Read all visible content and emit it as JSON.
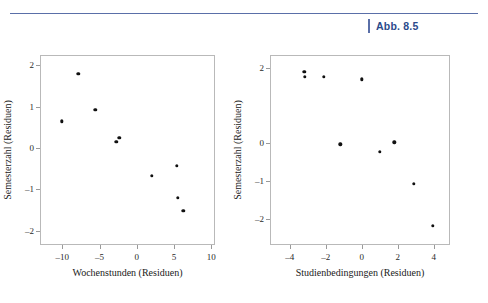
{
  "header": {
    "figure_label": "Abb. 8.5",
    "accent_color": "#2b4a8b",
    "rule_color": "#5a6fa8"
  },
  "chart_data": [
    {
      "id": "left",
      "type": "scatter",
      "title": "",
      "xlabel": "Wochenstunden (Residuen)",
      "ylabel": "Semesterzahl (Residuen)",
      "xlim": [
        -13,
        10.5
      ],
      "ylim": [
        -2.35,
        2.25
      ],
      "xticks": [
        -10,
        -5,
        0,
        5,
        10
      ],
      "xticklabels": [
        "–10",
        "–5",
        "0",
        "5",
        "10"
      ],
      "yticks": [
        2,
        1,
        0,
        -1,
        -2
      ],
      "yticklabels": [
        "2",
        "1",
        "0",
        "–1",
        "–2"
      ],
      "grid": false,
      "legend": "none",
      "marker_color": "#111111",
      "points": [
        {
          "x": -10.2,
          "y": 0.67
        },
        {
          "x": -8.0,
          "y": 1.82
        },
        {
          "x": -5.7,
          "y": 0.94
        },
        {
          "x": -2.9,
          "y": 0.17
        },
        {
          "x": -2.5,
          "y": 0.27
        },
        {
          "x": 1.9,
          "y": -0.65
        },
        {
          "x": 5.2,
          "y": -0.41
        },
        {
          "x": 5.4,
          "y": -1.19
        },
        {
          "x": 6.1,
          "y": -1.5
        }
      ]
    },
    {
      "id": "right",
      "type": "scatter",
      "title": "",
      "xlabel": "Studienbedingungen (Residuen)",
      "ylabel": "Semesterzahl (Residuen)",
      "xlim": [
        -5.1,
        4.9
      ],
      "ylim": [
        -2.7,
        2.35
      ],
      "xticks": [
        -4,
        -2,
        0,
        2,
        4
      ],
      "xticklabels": [
        "–4",
        "–2",
        "0",
        "2",
        "4"
      ],
      "yticks": [
        2,
        0,
        -1,
        -2
      ],
      "yticklabels": [
        "2",
        "0",
        "–1",
        "–2"
      ],
      "grid": false,
      "legend": "none",
      "marker_color": "#111111",
      "points": [
        {
          "x": -3.25,
          "y": 1.93
        },
        {
          "x": -3.22,
          "y": 1.8
        },
        {
          "x": -2.15,
          "y": 1.79
        },
        {
          "x": -1.25,
          "y": 0.0
        },
        {
          "x": -0.05,
          "y": 1.73
        },
        {
          "x": 0.95,
          "y": -0.19
        },
        {
          "x": 1.75,
          "y": 0.06
        },
        {
          "x": 2.85,
          "y": -1.05
        },
        {
          "x": 3.9,
          "y": -2.17
        }
      ]
    }
  ]
}
